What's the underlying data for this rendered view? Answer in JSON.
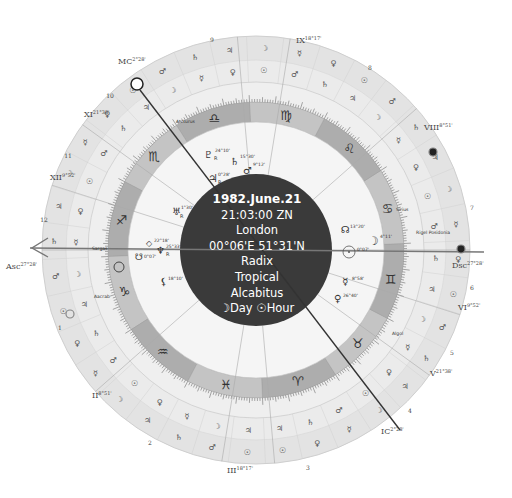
{
  "center": {
    "date": "1982.June.21",
    "time": "21:03:00 ZN",
    "place": "London",
    "coords": "00°06'E 51°31'N",
    "chart_type": "Radix",
    "zodiac": "Tropical",
    "house_system": "Alcabitus",
    "day_hour": "☽Day ☉Hour"
  },
  "colors": {
    "center_disc": "#3a3a3a",
    "zodiac_ring": "#b4b4b4",
    "zodiac_ring_alt": "#c6c6c6",
    "outer_ring": "#e2e2e2",
    "inner_ring": "#f4f4f4",
    "line": "#555555"
  },
  "angles": {
    "asc": {
      "label": "Asc",
      "deg": "27°28'"
    },
    "dsc": {
      "label": "Dsc",
      "deg": "27°28'"
    },
    "mc": {
      "label": "MC",
      "deg": "2°28'"
    },
    "ic": {
      "label": "IC",
      "deg": "2°28'"
    }
  },
  "houses": [
    {
      "label": "II",
      "deg": "8°51'"
    },
    {
      "label": "III",
      "deg": "18°17'"
    },
    {
      "label": "V",
      "deg": "21°38'"
    },
    {
      "label": "VI",
      "deg": "9°52'"
    },
    {
      "label": "VIII",
      "deg": "8°51'"
    },
    {
      "label": "IX",
      "deg": "18°17'"
    },
    {
      "label": "XI",
      "deg": "21°38'"
    },
    {
      "label": "XII",
      "deg": "9°52'"
    }
  ],
  "house_numbers": [
    "1",
    "2",
    "3",
    "4",
    "5",
    "6",
    "7",
    "8",
    "9",
    "10",
    "11",
    "12"
  ],
  "signs": [
    "♈",
    "♉",
    "♊",
    "♋",
    "♌",
    "♍",
    "♎",
    "♏",
    "♐",
    "♑",
    "♒",
    "♓"
  ],
  "planets": [
    {
      "name": "pluto",
      "glyph": "♇",
      "deg": "24°10'",
      "retro": "R"
    },
    {
      "name": "saturn",
      "glyph": "♄",
      "deg": "15°30'",
      "retro": ""
    },
    {
      "name": "mars",
      "glyph": "♂",
      "deg": "9°12'",
      "retro": ""
    },
    {
      "name": "jupiter",
      "glyph": "♃",
      "deg": "0°28'",
      "retro": "R"
    },
    {
      "name": "uranus",
      "glyph": "♅",
      "deg": "1°30'",
      "retro": "R"
    },
    {
      "name": "part-of-fortune",
      "glyph": "◇",
      "deg": "22°18'",
      "retro": ""
    },
    {
      "name": "neptune",
      "glyph": "♆",
      "deg": "25°33'",
      "retro": "R"
    },
    {
      "name": "south-node",
      "glyph": "☋",
      "deg": "0°07'",
      "retro": ""
    },
    {
      "name": "north-node",
      "glyph": "☊",
      "deg": "13°20'",
      "retro": ""
    },
    {
      "name": "moon",
      "glyph": "☽",
      "deg": "4°11'",
      "retro": ""
    },
    {
      "name": "sun",
      "glyph": "☉",
      "deg": "0°07'",
      "retro": ""
    },
    {
      "name": "mercury",
      "glyph": "☿",
      "deg": "8°58'",
      "retro": ""
    },
    {
      "name": "venus",
      "glyph": "♀",
      "deg": "26°40'",
      "retro": ""
    },
    {
      "name": "lilith",
      "glyph": "⚸",
      "deg": "18°10'",
      "retro": ""
    }
  ],
  "fixed_stars": [
    "Arcturus",
    "Sargas",
    "Acrab",
    "Rigel Posidonia",
    "Algol",
    "Spica"
  ],
  "fixed_star_labels": {
    "arcturus": "Arcturus",
    "sargas": "Sargas",
    "acrab": "Aacrab",
    "rigel": "Rigel Posidonia",
    "algol": "Algol",
    "sirius": "Sirius"
  }
}
